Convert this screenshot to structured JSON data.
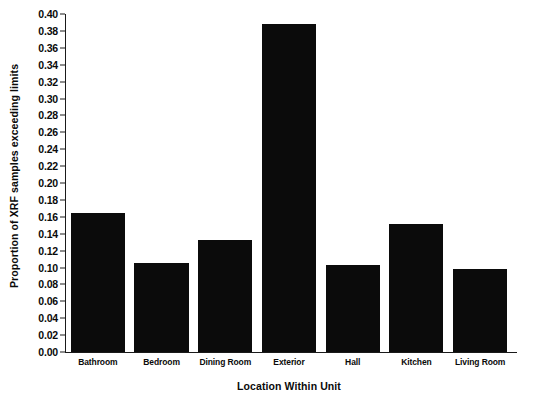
{
  "chart_data": {
    "type": "bar",
    "title": "",
    "xlabel": "Location Within Unit",
    "ylabel": "Proportion of XRF samples exceeding limits",
    "categories": [
      "Bathroom",
      "Bedroom",
      "Dining Room",
      "Exterior",
      "Hall",
      "Kitchen",
      "Living Room"
    ],
    "values": [
      0.165,
      0.105,
      0.132,
      0.388,
      0.103,
      0.152,
      0.098
    ],
    "ylim": [
      0.0,
      0.4
    ],
    "ytick_step": 0.02,
    "ytick_labels": [
      "0.00",
      "0.02",
      "0.04",
      "0.06",
      "0.08",
      "0.10",
      "0.12",
      "0.14",
      "0.16",
      "0.18",
      "0.20",
      "0.22",
      "0.24",
      "0.26",
      "0.28",
      "0.30",
      "0.32",
      "0.34",
      "0.36",
      "0.38",
      "0.40"
    ],
    "ytick_values": [
      0.0,
      0.02,
      0.04,
      0.06,
      0.08,
      0.1,
      0.12,
      0.14,
      0.16,
      0.18,
      0.2,
      0.22,
      0.24,
      0.26,
      0.28,
      0.3,
      0.32,
      0.34,
      0.36,
      0.38,
      0.4
    ],
    "grid": false,
    "legend": false,
    "bar_color": "#0b0b0b",
    "axis_color": "#1a1a1a"
  }
}
